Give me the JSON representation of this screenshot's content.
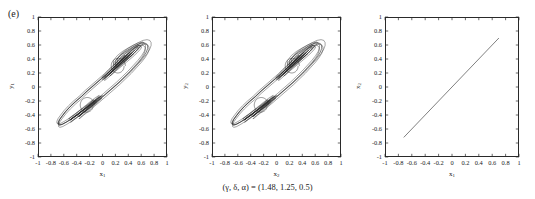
{
  "figure": {
    "panel_label": "(e)",
    "caption": "(γ, δ, α) = (1.48, 1.25, 0.5)",
    "line_color": "#2a2a2a",
    "background": "#ffffff"
  },
  "axis": {
    "ticks": [
      "-1",
      "-0.8",
      "-0.6",
      "-0.4",
      "-0.2",
      "0",
      "0.2",
      "0.4",
      "0.6",
      "0.8",
      "1"
    ],
    "tick_values": [
      -1,
      -0.8,
      -0.6,
      -0.4,
      -0.2,
      0,
      0.2,
      0.4,
      0.6,
      0.8,
      1
    ],
    "min": -1,
    "max": 1
  },
  "panels": [
    {
      "id": "panel-1",
      "xlabel": "x₁",
      "ylabel": "y₁",
      "xlabel_base": "x",
      "xlabel_sub": "1",
      "ylabel_base": "y",
      "ylabel_sub": "1"
    },
    {
      "id": "panel-2",
      "xlabel": "x₂",
      "ylabel": "y₂",
      "xlabel_base": "x",
      "xlabel_sub": "2",
      "ylabel_base": "y",
      "ylabel_sub": "2"
    },
    {
      "id": "panel-3",
      "xlabel": "x₁",
      "ylabel": "x₂",
      "xlabel_base": "x",
      "xlabel_sub": "1",
      "ylabel_base": "x",
      "ylabel_sub": "2"
    }
  ],
  "chart_data": [
    {
      "type": "line",
      "title": "",
      "xlabel": "x1",
      "ylabel": "y1",
      "xlim": [
        -1,
        1
      ],
      "ylim": [
        -1,
        1
      ],
      "grid": false,
      "legend": "none",
      "description": "Chaotic double-scroll (figure-eight) attractor phase portrait of oscillator 1.",
      "series": [
        {
          "name": "attractor-1",
          "x": [
            0.2,
            0.28,
            0.36,
            0.44,
            0.5,
            0.55,
            0.58,
            0.59,
            0.57,
            0.52,
            0.45,
            0.36,
            0.27,
            0.19,
            0.13,
            0.1,
            0.11,
            0.15,
            0.21,
            0.28,
            0.35,
            0.41,
            0.45,
            0.46,
            0.44,
            0.39,
            0.32,
            0.24,
            0.16,
            0.09,
            0.04,
            0.02,
            0.03,
            0.07,
            0.13,
            0.2,
            0.27,
            0.33,
            0.37,
            0.38,
            0.36,
            0.31,
            0.24,
            0.15,
            0.06,
            -0.04,
            -0.14,
            -0.24,
            -0.33,
            -0.42,
            -0.5,
            -0.57,
            -0.62,
            -0.66,
            -0.68,
            -0.68,
            -0.66,
            -0.62,
            -0.56,
            -0.49,
            -0.41,
            -0.33,
            -0.25,
            -0.18,
            -0.13,
            -0.1,
            -0.1,
            -0.13,
            -0.18,
            -0.24,
            -0.31,
            -0.38,
            -0.44,
            -0.48,
            -0.5,
            -0.49,
            -0.45,
            -0.39,
            -0.32,
            -0.24,
            -0.16,
            -0.09,
            -0.04,
            -0.02,
            -0.03,
            -0.06,
            -0.12,
            -0.19,
            -0.26,
            -0.32,
            -0.36,
            -0.37,
            -0.35,
            -0.3,
            -0.23,
            -0.14,
            -0.05,
            0.05,
            0.15,
            0.25,
            0.34,
            0.43,
            0.51,
            0.58,
            0.64,
            0.68,
            0.7,
            0.7,
            0.68,
            0.64,
            0.58,
            0.51,
            0.43,
            0.34,
            0.26,
            0.2
          ],
          "y": [
            0.3,
            0.38,
            0.45,
            0.51,
            0.56,
            0.59,
            0.6,
            0.59,
            0.56,
            0.51,
            0.45,
            0.38,
            0.31,
            0.25,
            0.2,
            0.18,
            0.19,
            0.23,
            0.28,
            0.34,
            0.4,
            0.45,
            0.48,
            0.49,
            0.47,
            0.43,
            0.37,
            0.3,
            0.23,
            0.17,
            0.13,
            0.12,
            0.14,
            0.18,
            0.24,
            0.3,
            0.36,
            0.41,
            0.44,
            0.45,
            0.43,
            0.39,
            0.33,
            0.26,
            0.18,
            0.1,
            0.02,
            -0.06,
            -0.14,
            -0.21,
            -0.28,
            -0.35,
            -0.41,
            -0.46,
            -0.5,
            -0.53,
            -0.54,
            -0.53,
            -0.5,
            -0.46,
            -0.41,
            -0.35,
            -0.3,
            -0.25,
            -0.21,
            -0.19,
            -0.19,
            -0.21,
            -0.25,
            -0.29,
            -0.34,
            -0.39,
            -0.43,
            -0.46,
            -0.47,
            -0.46,
            -0.43,
            -0.39,
            -0.34,
            -0.28,
            -0.22,
            -0.17,
            -0.14,
            -0.13,
            -0.14,
            -0.17,
            -0.22,
            -0.27,
            -0.33,
            -0.38,
            -0.41,
            -0.42,
            -0.41,
            -0.37,
            -0.32,
            -0.25,
            -0.18,
            -0.1,
            -0.02,
            0.06,
            0.14,
            0.22,
            0.3,
            0.37,
            0.44,
            0.5,
            0.55,
            0.59,
            0.62,
            0.63,
            0.62,
            0.59,
            0.55,
            0.5,
            0.44,
            0.37,
            0.3
          ]
        }
      ]
    },
    {
      "type": "line",
      "title": "",
      "xlabel": "x2",
      "ylabel": "y2",
      "xlim": [
        -1,
        1
      ],
      "ylim": [
        -1,
        1
      ],
      "grid": false,
      "legend": "none",
      "description": "Chaotic double-scroll (figure-eight) attractor phase portrait of oscillator 2; identical to panel 1 because the two oscillators are synchronized.",
      "series": [
        {
          "name": "attractor-2",
          "x": [
            0.2,
            0.28,
            0.36,
            0.44,
            0.5,
            0.55,
            0.58,
            0.59,
            0.57,
            0.52,
            0.45,
            0.36,
            0.27,
            0.19,
            0.13,
            0.1,
            0.11,
            0.15,
            0.21,
            0.28,
            0.35,
            0.41,
            0.45,
            0.46,
            0.44,
            0.39,
            0.32,
            0.24,
            0.16,
            0.09,
            0.04,
            0.02,
            0.03,
            0.07,
            0.13,
            0.2,
            0.27,
            0.33,
            0.37,
            0.38,
            0.36,
            0.31,
            0.24,
            0.15,
            0.06,
            -0.04,
            -0.14,
            -0.24,
            -0.33,
            -0.42,
            -0.5,
            -0.57,
            -0.62,
            -0.66,
            -0.68,
            -0.68,
            -0.66,
            -0.62,
            -0.56,
            -0.49,
            -0.41,
            -0.33,
            -0.25,
            -0.18,
            -0.13,
            -0.1,
            -0.1,
            -0.13,
            -0.18,
            -0.24,
            -0.31,
            -0.38,
            -0.44,
            -0.48,
            -0.5,
            -0.49,
            -0.45,
            -0.39,
            -0.32,
            -0.24,
            -0.16,
            -0.09,
            -0.04,
            -0.02,
            -0.03,
            -0.06,
            -0.12,
            -0.19,
            -0.26,
            -0.32,
            -0.36,
            -0.37,
            -0.35,
            -0.3,
            -0.23,
            -0.14,
            -0.05,
            0.05,
            0.15,
            0.25,
            0.34,
            0.43,
            0.51,
            0.58,
            0.64,
            0.68,
            0.7,
            0.7,
            0.68,
            0.64,
            0.58,
            0.51,
            0.43,
            0.34,
            0.26,
            0.2
          ],
          "y": [
            0.3,
            0.38,
            0.45,
            0.51,
            0.56,
            0.59,
            0.6,
            0.59,
            0.56,
            0.51,
            0.45,
            0.38,
            0.31,
            0.25,
            0.2,
            0.18,
            0.19,
            0.23,
            0.28,
            0.34,
            0.4,
            0.45,
            0.48,
            0.49,
            0.47,
            0.43,
            0.37,
            0.3,
            0.23,
            0.17,
            0.13,
            0.12,
            0.14,
            0.18,
            0.24,
            0.3,
            0.36,
            0.41,
            0.44,
            0.45,
            0.43,
            0.39,
            0.33,
            0.26,
            0.18,
            0.1,
            0.02,
            -0.06,
            -0.14,
            -0.21,
            -0.28,
            -0.35,
            -0.41,
            -0.46,
            -0.5,
            -0.53,
            -0.54,
            -0.53,
            -0.5,
            -0.46,
            -0.41,
            -0.35,
            -0.3,
            -0.25,
            -0.21,
            -0.19,
            -0.19,
            -0.21,
            -0.25,
            -0.29,
            -0.34,
            -0.39,
            -0.43,
            -0.46,
            -0.47,
            -0.46,
            -0.43,
            -0.39,
            -0.34,
            -0.28,
            -0.22,
            -0.17,
            -0.14,
            -0.13,
            -0.14,
            -0.17,
            -0.22,
            -0.27,
            -0.33,
            -0.38,
            -0.41,
            -0.42,
            -0.41,
            -0.37,
            -0.32,
            -0.25,
            -0.18,
            -0.1,
            -0.02,
            0.06,
            0.14,
            0.22,
            0.3,
            0.37,
            0.44,
            0.5,
            0.55,
            0.59,
            0.62,
            0.63,
            0.62,
            0.59,
            0.55,
            0.5,
            0.44,
            0.37,
            0.3
          ]
        }
      ]
    },
    {
      "type": "line",
      "title": "",
      "xlabel": "x1",
      "ylabel": "x2",
      "xlim": [
        -1,
        1
      ],
      "ylim": [
        -1,
        1
      ],
      "grid": false,
      "legend": "none",
      "description": "Synchronization manifold: x2 plotted against x1 collapses onto the identity diagonal x2 = x1.",
      "series": [
        {
          "name": "synchronization-diagonal",
          "x": [
            -0.72,
            0.7
          ],
          "y": [
            -0.72,
            0.7
          ]
        }
      ]
    }
  ]
}
